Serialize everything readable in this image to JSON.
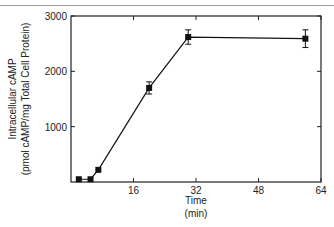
{
  "chart_data": {
    "type": "line",
    "title": "",
    "xlabel": "Time",
    "xlabel_unit": "(min)",
    "ylabel": "Intracellular cAMP",
    "ylabel_unit": "(pmol cAMP/mg Total Cell Protein)",
    "xlim": [
      0,
      64
    ],
    "ylim": [
      0,
      3000
    ],
    "x_ticks": [
      16,
      32,
      48,
      64
    ],
    "x_tick_labels": [
      "16",
      "32",
      "48",
      "64"
    ],
    "y_ticks": [
      1000,
      2000,
      3000
    ],
    "y_tick_labels": [
      "1000",
      "2000",
      "3000"
    ],
    "grid": false,
    "legend": null,
    "series": [
      {
        "name": "cAMP",
        "marker": "square",
        "color": "#111111",
        "x": [
          2,
          5,
          7,
          20,
          30,
          60
        ],
        "y": [
          50,
          50,
          220,
          1700,
          2620,
          2590
        ],
        "error": [
          0,
          0,
          0,
          110,
          130,
          160
        ]
      }
    ]
  }
}
